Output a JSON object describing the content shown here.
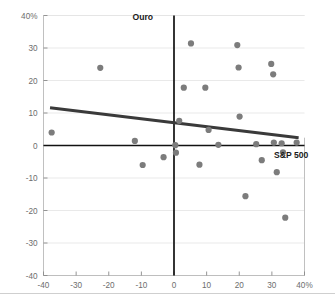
{
  "chart_data": {
    "type": "scatter",
    "title": "",
    "subtitle": "",
    "xlabel": "S&P 500",
    "ylabel": "Ouro",
    "xlim": [
      -40,
      40
    ],
    "ylim": [
      -40,
      40
    ],
    "grid": "horizontal",
    "legend_position": "none",
    "x_tick_labels": [
      "-40",
      "-30",
      "-20",
      "-10",
      "0",
      "10",
      "20",
      "30",
      "40%"
    ],
    "x_tick_values": [
      -40,
      -30,
      -20,
      -10,
      0,
      10,
      20,
      30,
      40
    ],
    "y_tick_labels": [
      "40%",
      "30",
      "20",
      "10",
      "0",
      "-10",
      "-20",
      "-30",
      "-40"
    ],
    "y_tick_values": [
      40,
      30,
      20,
      10,
      0,
      -10,
      -20,
      -30,
      -40
    ],
    "axis_unit": "%",
    "series": [
      {
        "name": "Ouro vs S&P 500 annual returns",
        "marker": "circle",
        "color": "#7c7c7c",
        "points": [
          {
            "x": -37.5,
            "y": 4.0
          },
          {
            "x": -22.6,
            "y": 23.9
          },
          {
            "x": -12.0,
            "y": 1.4
          },
          {
            "x": -9.6,
            "y": -6.0
          },
          {
            "x": -3.2,
            "y": -3.6
          },
          {
            "x": 0.4,
            "y": 0.1
          },
          {
            "x": 0.6,
            "y": -2.2
          },
          {
            "x": 1.6,
            "y": 7.6
          },
          {
            "x": 3.0,
            "y": 17.8
          },
          {
            "x": 5.2,
            "y": 31.4
          },
          {
            "x": 7.8,
            "y": -5.9
          },
          {
            "x": 9.6,
            "y": 17.8
          },
          {
            "x": 10.6,
            "y": 4.8
          },
          {
            "x": 13.6,
            "y": 0.2
          },
          {
            "x": 19.4,
            "y": 30.9
          },
          {
            "x": 19.8,
            "y": 24.0
          },
          {
            "x": 20.1,
            "y": 8.9
          },
          {
            "x": 21.9,
            "y": -15.6
          },
          {
            "x": 25.2,
            "y": 0.4
          },
          {
            "x": 26.9,
            "y": -4.5
          },
          {
            "x": 29.8,
            "y": 25.1
          },
          {
            "x": 30.4,
            "y": 21.9
          },
          {
            "x": 30.6,
            "y": 0.9
          },
          {
            "x": 31.5,
            "y": -8.2
          },
          {
            "x": 33.0,
            "y": 0.7
          },
          {
            "x": 33.4,
            "y": -2.1
          },
          {
            "x": 34.1,
            "y": -22.2
          },
          {
            "x": 37.6,
            "y": 0.9
          }
        ]
      }
    ],
    "trendline": {
      "type": "linear",
      "color": "#3a3a3a",
      "x_start": -38.0,
      "y_start": 11.6,
      "x_end": 38.2,
      "y_end": 2.4,
      "direction": "negative"
    }
  },
  "labels": {
    "y_axis_name": "Ouro",
    "x_axis_name": "S&P 500"
  }
}
